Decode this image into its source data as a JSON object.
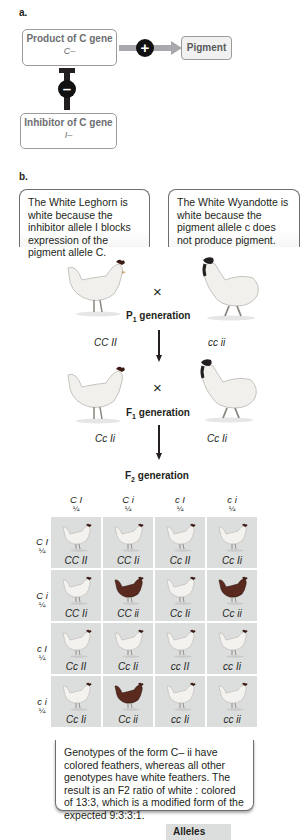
{
  "part_a": {
    "label": "a.",
    "product_box": {
      "title": "Product of C gene",
      "genotype": "C–"
    },
    "activation_sign": "+",
    "pigment_box": {
      "label": "Pigment"
    },
    "inhibition_sign": "–",
    "inhibitor_box": {
      "title": "Inhibitor of C gene",
      "genotype": "I–"
    }
  },
  "part_b": {
    "label": "b.",
    "callout_left": "The White Leghorn is white because the inhibitor allele I blocks expression of the pigment allele C.",
    "callout_right": "The White Wyandotte is white because the pigment allele c does not produce pigment.",
    "p1": {
      "cross_symbol": "×",
      "label": "P",
      "label_sub": "1",
      "label_suffix": " generation",
      "left_genotype": "CC II",
      "right_genotype": "cc ii"
    },
    "f1": {
      "cross_symbol": "×",
      "label": "F",
      "label_sub": "1",
      "label_suffix": " generation",
      "left_genotype": "Cc Ii",
      "right_genotype": "Cc Ii"
    },
    "f2": {
      "label": "F",
      "label_sub": "2",
      "label_suffix": " generation"
    },
    "punnett": {
      "column_headers": [
        {
          "allele": "C I",
          "fraction": "¼"
        },
        {
          "allele": "C i",
          "fraction": "¼"
        },
        {
          "allele": "c I",
          "fraction": "¼"
        },
        {
          "allele": "c i",
          "fraction": "¼"
        }
      ],
      "row_headers": [
        {
          "allele": "C I",
          "fraction": "¼"
        },
        {
          "allele": "C i",
          "fraction": "¼"
        },
        {
          "allele": "c I",
          "fraction": "¼"
        },
        {
          "allele": "c i",
          "fraction": "¼"
        }
      ],
      "cells": [
        [
          {
            "genotype": "CC II",
            "phenotype": "white"
          },
          {
            "genotype": "CC Ii",
            "phenotype": "white"
          },
          {
            "genotype": "Cc II",
            "phenotype": "white"
          },
          {
            "genotype": "Cc Ii",
            "phenotype": "white"
          }
        ],
        [
          {
            "genotype": "CC Ii",
            "phenotype": "white"
          },
          {
            "genotype": "CC ii",
            "phenotype": "colored"
          },
          {
            "genotype": "Cc Ii",
            "phenotype": "white"
          },
          {
            "genotype": "Cc ii",
            "phenotype": "colored"
          }
        ],
        [
          {
            "genotype": "Cc II",
            "phenotype": "white"
          },
          {
            "genotype": "Cc Ii",
            "phenotype": "white"
          },
          {
            "genotype": "cc II",
            "phenotype": "white"
          },
          {
            "genotype": "cc Ii",
            "phenotype": "white"
          }
        ],
        [
          {
            "genotype": "Cc Ii",
            "phenotype": "white"
          },
          {
            "genotype": "Cc ii",
            "phenotype": "colored"
          },
          {
            "genotype": "cc Ii",
            "phenotype": "white"
          },
          {
            "genotype": "cc ii",
            "phenotype": "white"
          }
        ]
      ]
    },
    "summary": "Genotypes of the form C– ii have colored feathers, whereas all other genotypes have white feathers. The result is an F2 ratio of white : colored of 13:3, which is a modified form of the expected 9:3:3:1.",
    "legend_title": "Alleles"
  },
  "colors": {
    "cell_bg": "#dcdddd",
    "white_hen": "#f4f2ee",
    "colored_hen": "#5b2a1f",
    "comb": "#3a1a12",
    "activation_bar": "#a7a9ac",
    "inhibition_bar": "#231f20"
  }
}
